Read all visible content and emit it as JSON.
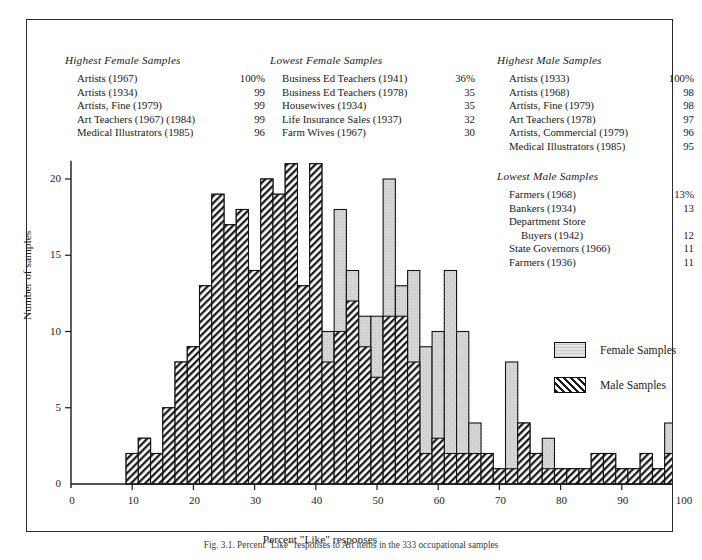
{
  "panels": [
    {
      "id": "highest-female",
      "title": "Highest Female Samples",
      "rows": [
        {
          "label": "Artists (1967)",
          "value": "100%"
        },
        {
          "label": "Artists (1934)",
          "value": "99"
        },
        {
          "label": "Artists, Fine (1979)",
          "value": "99"
        },
        {
          "label": "Art Teachers (1967) (1984)",
          "value": "99"
        },
        {
          "label": "Medical Illustrators (1985)",
          "value": "96"
        }
      ]
    },
    {
      "id": "lowest-female",
      "title": "Lowest Female Samples",
      "rows": [
        {
          "label": "Business Ed Teachers (1941)",
          "value": "36%"
        },
        {
          "label": "Business Ed Teachers (1978)",
          "value": "35"
        },
        {
          "label": "Housewives (1934)",
          "value": "35"
        },
        {
          "label": "Life Insurance Sales (1937)",
          "value": "32"
        },
        {
          "label": "Farm Wives (1967)",
          "value": "30"
        }
      ]
    },
    {
      "id": "highest-male",
      "title": "Highest Male Samples",
      "rows": [
        {
          "label": "Artists (1933)",
          "value": "100%"
        },
        {
          "label": "Artists (1968)",
          "value": "98"
        },
        {
          "label": "Artists, Fine (1979)",
          "value": "98"
        },
        {
          "label": "Art Teachers (1978)",
          "value": "97"
        },
        {
          "label": "Artists, Commercial (1979)",
          "value": "96"
        },
        {
          "label": "Medical Illustrators (1985)",
          "value": "95"
        }
      ]
    },
    {
      "id": "lowest-male",
      "title": "Lowest Male Samples",
      "rows": [
        {
          "label": "Farmers (1968)",
          "value": "13%"
        },
        {
          "label": "Bankers (1934)",
          "value": "13"
        },
        {
          "label": "Department Store",
          "value": "",
          "nosplit": true
        },
        {
          "label": "Buyers (1942)",
          "value": "12",
          "indent": true
        },
        {
          "label": "State Governors (1966)",
          "value": "11"
        },
        {
          "label": "Farmers (1936)",
          "value": "11"
        }
      ]
    }
  ],
  "legend": {
    "position": "inside-right",
    "items": [
      {
        "name": "Female Samples",
        "fill": "stipple-light",
        "color": "#d9d9d9"
      },
      {
        "name": "Male Samples",
        "fill": "diagonal-hatch",
        "color": "#ffffff"
      }
    ]
  },
  "caption": "Fig. 3.1. Percent \"Like\" responses to Art items in the 333 occupational samples",
  "chart_data": {
    "type": "bar",
    "subtype": "overlaid-histogram",
    "title": "",
    "xlabel": "Percent \"Like\" responses",
    "ylabel": "Number of samples",
    "xlim": [
      0,
      101
    ],
    "ylim": [
      0,
      21
    ],
    "xticks": [
      0,
      10,
      20,
      30,
      40,
      50,
      60,
      70,
      80,
      90,
      100
    ],
    "yticks": [
      0,
      5,
      10,
      15,
      20
    ],
    "grid": false,
    "bin_width": 2,
    "bin_starts": [
      9,
      11,
      13,
      15,
      17,
      19,
      21,
      23,
      25,
      27,
      29,
      31,
      33,
      35,
      37,
      39,
      41,
      43,
      45,
      47,
      49,
      51,
      53,
      55,
      57,
      59,
      61,
      63,
      65,
      67,
      69,
      71,
      73,
      75,
      77,
      79,
      81,
      83,
      85,
      87,
      89,
      91,
      93,
      95,
      97,
      99
    ],
    "series": [
      {
        "name": "Female Samples",
        "values": [
          2,
          3,
          2,
          5,
          8,
          9,
          13,
          19,
          17,
          18,
          14,
          20,
          19,
          21,
          13,
          21,
          10,
          18,
          14,
          11,
          11,
          20,
          13,
          14,
          9,
          10,
          14,
          10,
          4,
          2,
          1,
          8,
          4,
          2,
          3,
          1,
          1,
          1,
          2,
          2,
          1,
          1,
          2,
          1,
          4,
          2
        ]
      },
      {
        "name": "Male Samples",
        "values": [
          2,
          3,
          2,
          5,
          8,
          9,
          13,
          19,
          17,
          18,
          14,
          20,
          19,
          21,
          13,
          21,
          8,
          10,
          12,
          9,
          7,
          11,
          11,
          8,
          2,
          3,
          2,
          2,
          2,
          2,
          1,
          1,
          4,
          2,
          1,
          1,
          1,
          1,
          2,
          2,
          1,
          1,
          2,
          1,
          2,
          2
        ]
      }
    ]
  },
  "plot_geometry": {
    "x0_px": 70,
    "x_per_unit": 6.12,
    "y0_px": 483,
    "y_per_unit": 15.25
  }
}
